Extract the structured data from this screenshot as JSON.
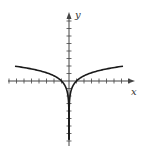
{
  "chart_data": {
    "type": "line",
    "title": "",
    "xlabel": "x",
    "ylabel": "y",
    "function": "y = ln|x|",
    "xlim": [
      -8,
      9
    ],
    "ylim": [
      -9,
      9
    ],
    "grid": false,
    "x_tick_step": 1,
    "y_tick_step": 1,
    "series": [
      {
        "name": "left branch",
        "x": [
          -7,
          -5,
          -3,
          -2,
          -1,
          -0.5,
          -0.2,
          -0.05
        ],
        "y": [
          1.95,
          1.61,
          1.1,
          0.69,
          0,
          -0.69,
          -1.61,
          -3.0
        ]
      },
      {
        "name": "right branch",
        "x": [
          0.05,
          0.2,
          0.5,
          1,
          2,
          3,
          5,
          7
        ],
        "y": [
          -3.0,
          -1.61,
          -0.69,
          0,
          0.69,
          1.1,
          1.61,
          1.95
        ]
      }
    ]
  },
  "labels": {
    "x": "x",
    "y": "y"
  },
  "colors": {
    "axis": "#444444",
    "curve": "#1a1a1a"
  }
}
